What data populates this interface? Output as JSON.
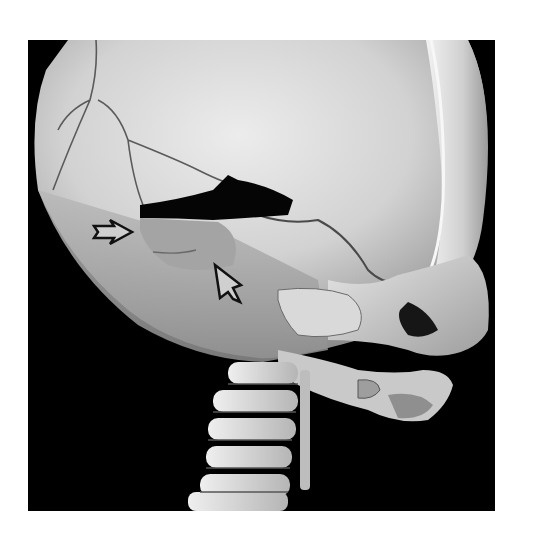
{
  "figure": {
    "type": "3D CT volume rendering",
    "background_color": "#000000",
    "bone_color": "#d8d8d8",
    "page_background": "#ffffff"
  },
  "annotations": [
    {
      "name": "arrow-right",
      "direction": "right",
      "tip": [
        132,
        232
      ],
      "color": "#111111",
      "fill": "#cfcfcf"
    },
    {
      "name": "arrow-up-left",
      "direction": "up-left",
      "tip": [
        215,
        265
      ],
      "color": "#111111",
      "fill": "#cfcfcf"
    }
  ]
}
